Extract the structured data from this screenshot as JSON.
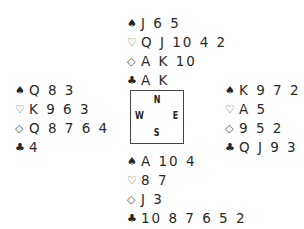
{
  "suits": {
    "spades": "♠",
    "hearts": "♡",
    "diamonds": "◇",
    "clubs": "♣"
  },
  "hands": {
    "north": {
      "spades": "J 6 5",
      "hearts": "Q J 10 4 2",
      "diamonds": "A K 10",
      "clubs": "A K"
    },
    "west": {
      "spades": "Q 8 3",
      "hearts": "K 9 6 3",
      "diamonds": "Q 8 7 6 4",
      "clubs": "4"
    },
    "east": {
      "spades": "K 9 7 2",
      "hearts": "A 5",
      "diamonds": "9 5 2",
      "clubs": "Q J 9 3"
    },
    "south": {
      "spades": "A 10 4",
      "hearts": "8 7",
      "diamonds": "J 3",
      "clubs": "10 8 7 6 5 2"
    }
  },
  "compass": {
    "n": "N",
    "w": "W",
    "e": "E",
    "s": "S"
  }
}
